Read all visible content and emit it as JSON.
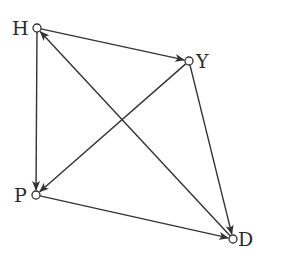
{
  "diagram": {
    "type": "directed-graph",
    "width": 281,
    "height": 259,
    "colors": {
      "background": "#ffffff",
      "stroke": "#333333",
      "text": "#2a2a2a"
    },
    "nodes": [
      {
        "id": "H",
        "label": "H",
        "x": 37,
        "y": 28,
        "label_x": 12,
        "label_y": 35,
        "label_anchor": "start"
      },
      {
        "id": "Y",
        "label": "Y",
        "x": 189,
        "y": 61,
        "label_x": 196,
        "label_y": 68,
        "label_anchor": "start"
      },
      {
        "id": "P",
        "label": "P",
        "x": 36,
        "y": 195,
        "label_x": 14,
        "label_y": 202,
        "label_anchor": "start"
      },
      {
        "id": "D",
        "label": "D",
        "x": 233,
        "y": 239,
        "label_x": 238,
        "label_y": 246,
        "label_anchor": "start"
      }
    ],
    "edges": [
      {
        "from": "H",
        "to": "Y"
      },
      {
        "from": "H",
        "to": "P"
      },
      {
        "from": "Y",
        "to": "P"
      },
      {
        "from": "Y",
        "to": "D"
      },
      {
        "from": "P",
        "to": "D"
      },
      {
        "from": "D",
        "to": "H"
      }
    ],
    "node_radius": 4
  }
}
